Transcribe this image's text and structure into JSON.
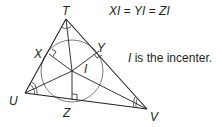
{
  "diagram": {
    "type": "geometry",
    "vertices": {
      "T": {
        "label": "T",
        "x": 66,
        "y": 19
      },
      "U": {
        "label": "U",
        "x": 25,
        "y": 93
      },
      "V": {
        "label": "V",
        "x": 147,
        "y": 109
      }
    },
    "incenter": {
      "label": "I",
      "x": 72,
      "y": 71,
      "radius": 31
    },
    "tangent_points": {
      "X": {
        "label": "X",
        "x": 49,
        "y": 54
      },
      "Y": {
        "label": "Y",
        "x": 99,
        "y": 51
      },
      "Z": {
        "label": "Z",
        "x": 72,
        "y": 100
      }
    },
    "equation": {
      "parts": [
        "XI",
        " = ",
        "YI",
        " = ",
        "ZI"
      ]
    },
    "note": {
      "italic": "I",
      "rest": " is the incenter."
    },
    "colors": {
      "lines": "#231f20",
      "circle": "#6d6e71",
      "background": "#ffffff"
    }
  }
}
